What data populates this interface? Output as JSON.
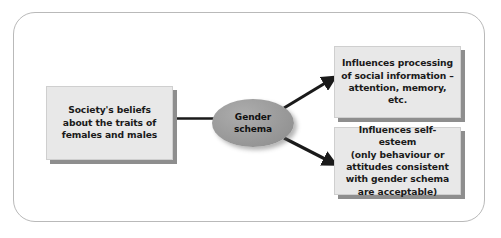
{
  "diagram": {
    "title_visible": false,
    "frame": {
      "border_color": "#b9b9b9",
      "background_color": "#ffffff"
    },
    "nodes": {
      "society": {
        "label": "Society's beliefs\nabout the traits of\nfemales and males",
        "shape": "rectangle",
        "fill_color": "#e8e8e8",
        "shadow_color": "#8e8e8e"
      },
      "gender_schema": {
        "label": "Gender\nschema",
        "shape": "ellipse",
        "fill_color": "#9a9a9a"
      },
      "processing": {
        "label": "Influences processing\nof social information –\nattention, memory, etc.",
        "shape": "rectangle",
        "fill_color": "#e8e8e8",
        "shadow_color": "#8e8e8e"
      },
      "self_esteem": {
        "label": "Influences self-esteem\n(only behaviour or\nattitudes consistent\nwith gender schema\nare acceptable)",
        "shape": "rectangle",
        "fill_color": "#e8e8e8",
        "shadow_color": "#8e8e8e"
      }
    },
    "connectors": [
      {
        "name": "society-to-gender-schema",
        "from": "society",
        "to": "gender_schema",
        "style": "line",
        "arrowhead": false,
        "color": "#1a1a1a"
      },
      {
        "name": "gender-schema-to-processing",
        "from": "gender_schema",
        "to": "processing",
        "style": "arrow",
        "arrowhead": true,
        "color": "#1a1a1a"
      },
      {
        "name": "gender-schema-to-self-esteem",
        "from": "gender_schema",
        "to": "self_esteem",
        "style": "arrow",
        "arrowhead": true,
        "color": "#1a1a1a"
      }
    ]
  }
}
